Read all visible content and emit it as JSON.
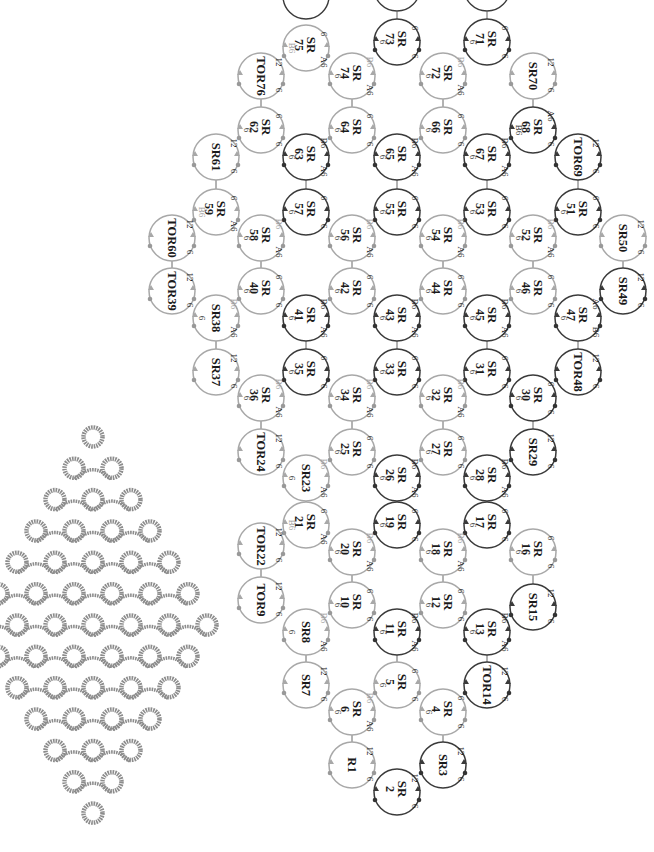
{
  "figure": {
    "left_panel": "Photograph of finished tatted lace diamond motif",
    "right_panel": "Rotated tatting construction diagram with numbered rings"
  },
  "colors": {
    "light_ring": "#a8a8a8",
    "dark_ring": "#3a3a3a",
    "lace": "#8c8c8c",
    "text": "#1a1a1a",
    "faint_text": "#9a9a9a"
  },
  "legend_abbrev": {
    "SR": "split ring",
    "TOR": "thrown-off ring",
    "R": "ring"
  },
  "rings": [
    {
      "id": "SR75",
      "label1": "SR",
      "label2": "75",
      "x": 306,
      "y": 48,
      "tone": "light",
      "notes": [
        "6",
        "A6",
        "B6"
      ]
    },
    {
      "id": "SR73",
      "label1": "SR",
      "label2": "73",
      "x": 397,
      "y": 42,
      "tone": "dark",
      "notes": [
        "6",
        "6",
        "6"
      ]
    },
    {
      "id": "SR71",
      "label1": "SR",
      "label2": "71",
      "x": 487,
      "y": 42,
      "tone": "dark",
      "notes": [
        "6",
        "6",
        "6"
      ]
    },
    {
      "id": "TOR76",
      "label1": "TOR76",
      "label2": "",
      "x": 261,
      "y": 76,
      "tone": "light",
      "notes": [
        "12",
        "6"
      ]
    },
    {
      "id": "SR74",
      "label1": "SR",
      "label2": "74",
      "x": 352,
      "y": 76,
      "tone": "light",
      "notes": [
        "B6",
        "A6",
        "6"
      ]
    },
    {
      "id": "SR72",
      "label1": "SR",
      "label2": "72",
      "x": 443,
      "y": 76,
      "tone": "light",
      "notes": [
        "B6",
        "A6",
        "6"
      ]
    },
    {
      "id": "SR70",
      "label1": "SR70",
      "label2": "",
      "x": 533,
      "y": 76,
      "tone": "light",
      "notes": [
        "12",
        "6"
      ]
    },
    {
      "id": "SR62",
      "label1": "SR",
      "label2": "62",
      "x": 261,
      "y": 130,
      "tone": "light",
      "notes": [
        "6",
        "6",
        "6"
      ]
    },
    {
      "id": "SR64",
      "label1": "SR",
      "label2": "64",
      "x": 352,
      "y": 130,
      "tone": "light",
      "notes": [
        "6",
        "6",
        "6"
      ]
    },
    {
      "id": "SR66",
      "label1": "SR",
      "label2": "66",
      "x": 443,
      "y": 130,
      "tone": "light",
      "notes": [
        "6",
        "6",
        "6"
      ]
    },
    {
      "id": "SR68",
      "label1": "SR",
      "label2": "68",
      "x": 533,
      "y": 130,
      "tone": "dark",
      "notes": [
        "A6",
        "6",
        "B6"
      ]
    },
    {
      "id": "SR61",
      "label1": "SR61",
      "label2": "",
      "x": 216,
      "y": 157,
      "tone": "light",
      "notes": [
        "12",
        "6"
      ]
    },
    {
      "id": "SR63",
      "label1": "SR",
      "label2": "63",
      "x": 306,
      "y": 157,
      "tone": "dark",
      "notes": [
        "B6",
        "A6",
        "6"
      ]
    },
    {
      "id": "SR65",
      "label1": "SR",
      "label2": "65",
      "x": 397,
      "y": 157,
      "tone": "dark",
      "notes": [
        "B6",
        "A6",
        "6"
      ]
    },
    {
      "id": "SR67",
      "label1": "SR",
      "label2": "67",
      "x": 487,
      "y": 157,
      "tone": "dark",
      "notes": [
        "B6",
        "A6",
        "6"
      ]
    },
    {
      "id": "TOR69",
      "label1": "TOR69",
      "label2": "",
      "x": 578,
      "y": 157,
      "tone": "dark",
      "notes": [
        "12",
        "6"
      ]
    },
    {
      "id": "SR59",
      "label1": "SR",
      "label2": "59",
      "x": 216,
      "y": 212,
      "tone": "light",
      "notes": [
        "6",
        "A6",
        "B6"
      ]
    },
    {
      "id": "SR57",
      "label1": "SR",
      "label2": "57",
      "x": 306,
      "y": 212,
      "tone": "dark",
      "notes": [
        "6",
        "6",
        "6"
      ]
    },
    {
      "id": "SR55",
      "label1": "SR",
      "label2": "55",
      "x": 397,
      "y": 212,
      "tone": "dark",
      "notes": [
        "6",
        "6",
        "6"
      ]
    },
    {
      "id": "SR53",
      "label1": "SR",
      "label2": "53",
      "x": 487,
      "y": 212,
      "tone": "dark",
      "notes": [
        "6",
        "6",
        "6"
      ]
    },
    {
      "id": "SR51",
      "label1": "SR",
      "label2": "51",
      "x": 578,
      "y": 212,
      "tone": "dark",
      "notes": [
        "6",
        "6",
        "6"
      ]
    },
    {
      "id": "TOR60",
      "label1": "TOR60",
      "label2": "",
      "x": 172,
      "y": 238,
      "tone": "light",
      "notes": [
        "12",
        "6"
      ]
    },
    {
      "id": "SR58",
      "label1": "SR",
      "label2": "58",
      "x": 261,
      "y": 238,
      "tone": "light",
      "notes": [
        "B6",
        "A6",
        "6"
      ]
    },
    {
      "id": "SR56",
      "label1": "SR",
      "label2": "56",
      "x": 352,
      "y": 238,
      "tone": "light",
      "notes": [
        "B6",
        "A6",
        "6"
      ]
    },
    {
      "id": "SR54",
      "label1": "SR",
      "label2": "54",
      "x": 443,
      "y": 238,
      "tone": "light",
      "notes": [
        "B6",
        "A6",
        "6"
      ]
    },
    {
      "id": "SR52",
      "label1": "SR",
      "label2": "52",
      "x": 533,
      "y": 238,
      "tone": "light",
      "notes": [
        "B6",
        "A6",
        "6"
      ]
    },
    {
      "id": "SR50",
      "label1": "SR50",
      "label2": "",
      "x": 623,
      "y": 238,
      "tone": "light",
      "notes": [
        "12",
        "6"
      ]
    },
    {
      "id": "TOR39",
      "label1": "TOR39",
      "label2": "",
      "x": 172,
      "y": 291,
      "tone": "light",
      "notes": [
        "12",
        "6"
      ]
    },
    {
      "id": "SR40",
      "label1": "SR",
      "label2": "40",
      "x": 261,
      "y": 291,
      "tone": "light",
      "notes": [
        "6",
        "6",
        "6"
      ]
    },
    {
      "id": "SR42",
      "label1": "SR",
      "label2": "42",
      "x": 352,
      "y": 291,
      "tone": "light",
      "notes": [
        "6",
        "6",
        "6"
      ]
    },
    {
      "id": "SR44",
      "label1": "SR",
      "label2": "44",
      "x": 443,
      "y": 291,
      "tone": "light",
      "notes": [
        "6",
        "6",
        "6"
      ]
    },
    {
      "id": "SR46",
      "label1": "SR",
      "label2": "46",
      "x": 533,
      "y": 291,
      "tone": "light",
      "notes": [
        "6",
        "6",
        "6"
      ]
    },
    {
      "id": "SR49",
      "label1": "SR49",
      "label2": "",
      "x": 623,
      "y": 291,
      "tone": "dark",
      "notes": [
        "12",
        "6"
      ]
    },
    {
      "id": "SR38",
      "label1": "SR38",
      "label2": "",
      "x": 216,
      "y": 318,
      "tone": "light",
      "notes": [
        "B6",
        "A6",
        "6"
      ]
    },
    {
      "id": "SR41",
      "label1": "SR",
      "label2": "41",
      "x": 306,
      "y": 318,
      "tone": "dark",
      "notes": [
        "B6",
        "A6",
        "6"
      ]
    },
    {
      "id": "SR43",
      "label1": "SR",
      "label2": "43",
      "x": 397,
      "y": 318,
      "tone": "dark",
      "notes": [
        "B6",
        "A6",
        "6"
      ]
    },
    {
      "id": "SR45",
      "label1": "SR",
      "label2": "45",
      "x": 487,
      "y": 318,
      "tone": "dark",
      "notes": [
        "B6",
        "A6",
        "6"
      ]
    },
    {
      "id": "SR47",
      "label1": "SR",
      "label2": "47",
      "x": 578,
      "y": 318,
      "tone": "dark",
      "notes": [
        "A6",
        "B6",
        "6"
      ]
    },
    {
      "id": "SR37",
      "label1": "SR37",
      "label2": "",
      "x": 216,
      "y": 372,
      "tone": "light",
      "notes": [
        "12",
        "6"
      ]
    },
    {
      "id": "SR35",
      "label1": "SR",
      "label2": "35",
      "x": 306,
      "y": 372,
      "tone": "dark",
      "notes": [
        "6",
        "6",
        "6"
      ]
    },
    {
      "id": "SR33",
      "label1": "SR",
      "label2": "33",
      "x": 397,
      "y": 372,
      "tone": "dark",
      "notes": [
        "6",
        "6",
        "6"
      ]
    },
    {
      "id": "SR31",
      "label1": "SR",
      "label2": "31",
      "x": 487,
      "y": 372,
      "tone": "dark",
      "notes": [
        "6",
        "6",
        "6"
      ]
    },
    {
      "id": "TOR48",
      "label1": "TOR48",
      "label2": "",
      "x": 578,
      "y": 372,
      "tone": "dark",
      "notes": [
        "12",
        "6"
      ]
    },
    {
      "id": "SR36",
      "label1": "SR",
      "label2": "36",
      "x": 261,
      "y": 398,
      "tone": "light",
      "notes": [
        "B6",
        "A6",
        "6"
      ]
    },
    {
      "id": "SR34",
      "label1": "SR",
      "label2": "34",
      "x": 352,
      "y": 398,
      "tone": "light",
      "notes": [
        "B6",
        "A6",
        "6"
      ]
    },
    {
      "id": "SR32",
      "label1": "SR",
      "label2": "32",
      "x": 443,
      "y": 398,
      "tone": "light",
      "notes": [
        "B6",
        "A6",
        "6"
      ]
    },
    {
      "id": "SR30",
      "label1": "SR",
      "label2": "30",
      "x": 533,
      "y": 398,
      "tone": "dark",
      "notes": [
        "6",
        "6",
        "6"
      ]
    },
    {
      "id": "TOR24",
      "label1": "TOR24",
      "label2": "",
      "x": 261,
      "y": 452,
      "tone": "light",
      "notes": [
        "12",
        "6"
      ]
    },
    {
      "id": "SR25",
      "label1": "SR",
      "label2": "25",
      "x": 352,
      "y": 452,
      "tone": "light",
      "notes": [
        "6",
        "6",
        "6"
      ]
    },
    {
      "id": "SR27",
      "label1": "SR",
      "label2": "27",
      "x": 443,
      "y": 452,
      "tone": "light",
      "notes": [
        "6",
        "6",
        "6"
      ]
    },
    {
      "id": "SR29",
      "label1": "SR29",
      "label2": "",
      "x": 533,
      "y": 452,
      "tone": "dark",
      "notes": [
        "12",
        "6"
      ]
    },
    {
      "id": "SR23",
      "label1": "SR23",
      "label2": "",
      "x": 306,
      "y": 478,
      "tone": "light",
      "notes": [
        "B6",
        "A6",
        "6"
      ]
    },
    {
      "id": "SR26",
      "label1": "SR",
      "label2": "26",
      "x": 397,
      "y": 478,
      "tone": "dark",
      "notes": [
        "B6",
        "A6",
        "6"
      ]
    },
    {
      "id": "SR28",
      "label1": "SR",
      "label2": "28",
      "x": 487,
      "y": 478,
      "tone": "dark",
      "notes": [
        "B6",
        "A6",
        "6"
      ]
    },
    {
      "id": "SR21",
      "label1": "SR",
      "label2": "21",
      "x": 306,
      "y": 525,
      "tone": "light",
      "notes": [
        "6",
        "A6",
        "B6"
      ]
    },
    {
      "id": "SR19",
      "label1": "SR",
      "label2": "19",
      "x": 397,
      "y": 525,
      "tone": "dark",
      "notes": [
        "6",
        "6",
        "6"
      ]
    },
    {
      "id": "SR17",
      "label1": "SR",
      "label2": "17",
      "x": 487,
      "y": 525,
      "tone": "dark",
      "notes": [
        "6",
        "6",
        "6"
      ]
    },
    {
      "id": "TOR22",
      "label1": "TOR22",
      "label2": "",
      "x": 261,
      "y": 546,
      "tone": "light",
      "notes": [
        "12",
        "6"
      ]
    },
    {
      "id": "SR20",
      "label1": "SR",
      "label2": "20",
      "x": 352,
      "y": 552,
      "tone": "light",
      "notes": [
        "B6",
        "A6",
        "6"
      ]
    },
    {
      "id": "SR18",
      "label1": "SR",
      "label2": "18",
      "x": 443,
      "y": 552,
      "tone": "light",
      "notes": [
        "B6",
        "A6",
        "6"
      ]
    },
    {
      "id": "SR16",
      "label1": "SR",
      "label2": "16",
      "x": 533,
      "y": 552,
      "tone": "light",
      "notes": [
        "6",
        "6",
        "6"
      ]
    },
    {
      "id": "TOR9",
      "label1": "TOR9",
      "label2": "",
      "x": 261,
      "y": 600,
      "tone": "light",
      "notes": [
        "12",
        "6"
      ]
    },
    {
      "id": "SR10",
      "label1": "SR",
      "label2": "10",
      "x": 352,
      "y": 605,
      "tone": "light",
      "notes": [
        "6",
        "6",
        "6"
      ]
    },
    {
      "id": "SR12",
      "label1": "SR",
      "label2": "12",
      "x": 443,
      "y": 605,
      "tone": "light",
      "notes": [
        "6",
        "6",
        "6"
      ]
    },
    {
      "id": "SR15",
      "label1": "SR15",
      "label2": "",
      "x": 533,
      "y": 607,
      "tone": "dark",
      "notes": [
        "12",
        "6"
      ]
    },
    {
      "id": "SR8",
      "label1": "SR8",
      "label2": "",
      "x": 306,
      "y": 632,
      "tone": "light",
      "notes": [
        "B6",
        "A6",
        "6"
      ]
    },
    {
      "id": "SR11",
      "label1": "SR",
      "label2": "11",
      "x": 397,
      "y": 632,
      "tone": "dark",
      "notes": [
        "B6",
        "A6",
        "6"
      ]
    },
    {
      "id": "SR13",
      "label1": "SR",
      "label2": "13",
      "x": 487,
      "y": 632,
      "tone": "dark",
      "notes": [
        "B6",
        "A6",
        "6"
      ]
    },
    {
      "id": "SR7",
      "label1": "SR7",
      "label2": "",
      "x": 306,
      "y": 685,
      "tone": "light",
      "notes": [
        "12",
        "6"
      ]
    },
    {
      "id": "SR5",
      "label1": "SR",
      "label2": "5",
      "x": 397,
      "y": 685,
      "tone": "light",
      "notes": [
        "6",
        "6",
        "6"
      ]
    },
    {
      "id": "TOR14",
      "label1": "TOR14",
      "label2": "",
      "x": 487,
      "y": 685,
      "tone": "dark",
      "notes": [
        "12",
        "6"
      ]
    },
    {
      "id": "SR6",
      "label1": "SR",
      "label2": "6",
      "x": 352,
      "y": 712,
      "tone": "light",
      "notes": [
        "B6",
        "A6",
        "6"
      ]
    },
    {
      "id": "SR4",
      "label1": "SR",
      "label2": "4",
      "x": 443,
      "y": 712,
      "tone": "light",
      "notes": [
        "6",
        "6",
        "6"
      ]
    },
    {
      "id": "R1",
      "label1": "R1",
      "label2": "",
      "x": 352,
      "y": 765,
      "tone": "light",
      "notes": [
        "12",
        "6"
      ]
    },
    {
      "id": "SR3",
      "label1": "SR3",
      "label2": "",
      "x": 443,
      "y": 765,
      "tone": "dark",
      "notes": [
        "12",
        "6"
      ]
    },
    {
      "id": "SR2",
      "label1": "SR",
      "label2": "2",
      "x": 397,
      "y": 792,
      "tone": "dark",
      "notes": [
        "12",
        "6"
      ]
    }
  ],
  "top_partial_rings": [
    {
      "x": 306,
      "y": -4,
      "tone": "dark"
    },
    {
      "x": 397,
      "y": -12,
      "tone": "dark"
    },
    {
      "x": 487,
      "y": -12,
      "tone": "dark"
    }
  ]
}
